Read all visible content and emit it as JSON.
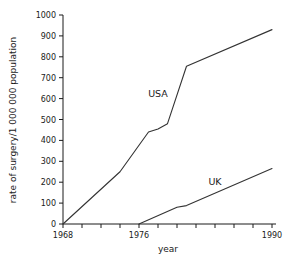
{
  "chart_data": {
    "type": "line",
    "title": "",
    "xlabel": "year",
    "ylabel": "rate of surgery/1 000 000 population",
    "xlim": [
      1968,
      1990
    ],
    "ylim": [
      0,
      1000
    ],
    "ytick_step": 100,
    "xtick_step": 2,
    "grid": false,
    "legend": "inline-labels",
    "ytick_labels": [
      "0",
      "100",
      "200",
      "300",
      "400",
      "500",
      "600",
      "700",
      "800",
      "900",
      "1000"
    ],
    "ytick_values": [
      0,
      100,
      200,
      300,
      400,
      500,
      600,
      700,
      800,
      900,
      1000
    ],
    "xtick_values": [
      1968,
      1970,
      1972,
      1974,
      1976,
      1978,
      1980,
      1982,
      1984,
      1986,
      1988,
      1990
    ],
    "xtick_labels_shown": [
      "1968",
      "1976",
      "1990"
    ],
    "xtick_labels_shown_values": [
      1968,
      1976,
      1990
    ],
    "series": [
      {
        "name": "USA",
        "color": "#333333",
        "label_text": "USA",
        "x": [
          1968,
          1974,
          1977,
          1978,
          1979,
          1981,
          1990
        ],
        "values": [
          0,
          250,
          440,
          455,
          480,
          755,
          930
        ]
      },
      {
        "name": "UK",
        "color": "#333333",
        "label_text": "UK",
        "x": [
          1976,
          1980,
          1981,
          1990
        ],
        "values": [
          0,
          80,
          88,
          265
        ]
      }
    ],
    "annotations": [
      {
        "text": "USA",
        "x": 1978.0,
        "y": 610
      },
      {
        "text": "UK",
        "x": 1984.0,
        "y": 185
      }
    ]
  },
  "axis": {
    "x_title": "year",
    "y_title": "rate of surgery/1 000 000 population"
  },
  "colors": {
    "line": "#333333",
    "axis": "#1a1a1a",
    "text": "#1a1a1a",
    "background": "#ffffff"
  }
}
